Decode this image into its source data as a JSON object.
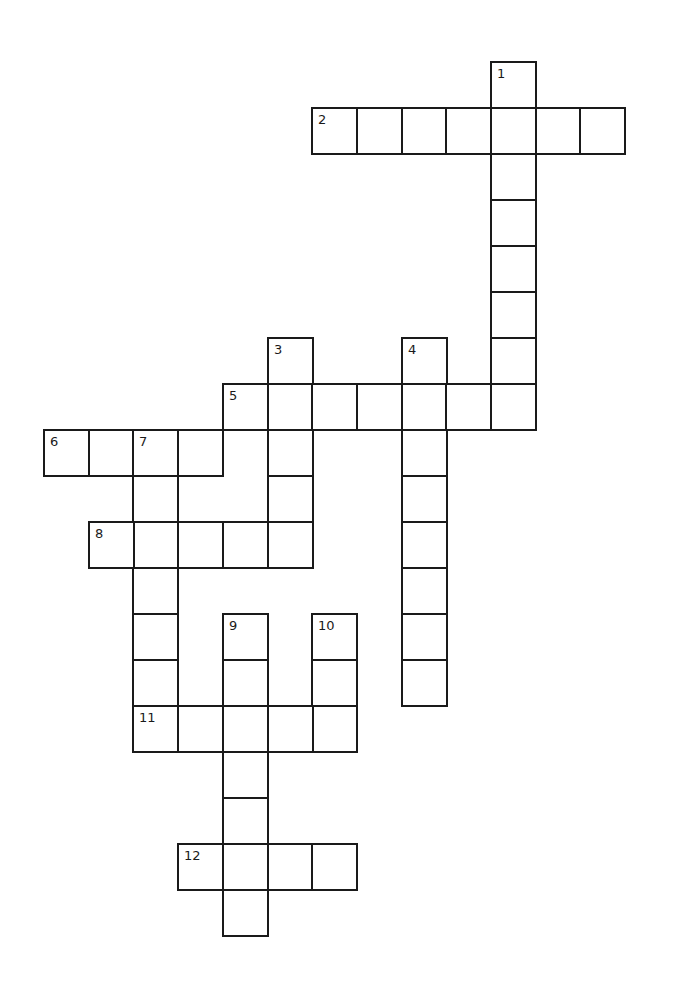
{
  "puzzle": {
    "grid_origin": {
      "x": 44,
      "y": 62
    },
    "cell_pitch": {
      "x": 44.7,
      "y": 46
    },
    "line_color": "#1a1a1a",
    "background": "#ffffff",
    "entries": [
      {
        "number": "1",
        "direction": "down",
        "row": 0,
        "col": 10,
        "length": 8
      },
      {
        "number": "2",
        "direction": "across",
        "row": 1,
        "col": 6,
        "length": 7
      },
      {
        "number": "3",
        "direction": "down",
        "row": 6,
        "col": 5,
        "length": 5
      },
      {
        "number": "4",
        "direction": "down",
        "row": 6,
        "col": 8,
        "length": 8
      },
      {
        "number": "5",
        "direction": "across",
        "row": 7,
        "col": 4,
        "length": 7
      },
      {
        "number": "6",
        "direction": "across",
        "row": 8,
        "col": 0,
        "length": 4
      },
      {
        "number": "7",
        "direction": "down",
        "row": 8,
        "col": 2,
        "length": 7
      },
      {
        "number": "8",
        "direction": "across",
        "row": 10,
        "col": 1,
        "length": 5
      },
      {
        "number": "9",
        "direction": "down",
        "row": 12,
        "col": 4,
        "length": 7
      },
      {
        "number": "10",
        "direction": "down",
        "row": 12,
        "col": 6,
        "length": 3
      },
      {
        "number": "11",
        "direction": "across",
        "row": 14,
        "col": 2,
        "length": 5
      },
      {
        "number": "12",
        "direction": "across",
        "row": 17,
        "col": 3,
        "length": 4
      }
    ]
  }
}
